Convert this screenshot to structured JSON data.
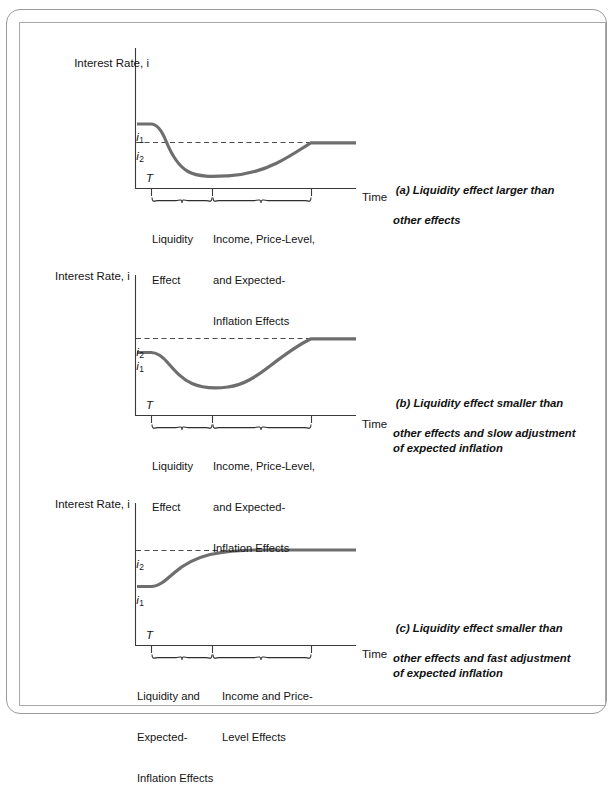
{
  "figure": {
    "title_present": false,
    "background_color": "#ffffff",
    "curve_color": "#6e6e6e",
    "axis_color": "#3a3a3a",
    "frame_color": "#9a9a9a"
  },
  "common": {
    "y_axis_title": "Interest Rate, ",
    "y_axis_title_symbol": "i",
    "x_axis_title": "Time",
    "t_marker": "T",
    "level_1_symbol": "i",
    "level_1_subscript": "1",
    "level_2_symbol": "i",
    "level_2_subscript": "2"
  },
  "panels": [
    {
      "id": "a",
      "caption_lead": "(a) Liquidity effect larger than",
      "caption_rest": "other effects",
      "y_axis_title": "Interest Rate, i",
      "x_axis_title": "Time",
      "t_marker": "T",
      "labels": {
        "i1": "i",
        "i1_sub": "1",
        "i2": "i",
        "i2_sub": "2"
      },
      "i1_above_i2": true,
      "brackets": [
        {
          "name": "liquidity-effect",
          "lines": [
            "Liquidity",
            "Effect"
          ]
        },
        {
          "name": "income-price-level-expected-inflation-effects",
          "lines": [
            "Income, Price-Level,",
            "and Expected-",
            "Inflation Effects"
          ]
        }
      ]
    },
    {
      "id": "b",
      "caption_lead": "(b) Liquidity effect smaller than",
      "caption_rest": "other effects and slow adjustment\nof expected inflation",
      "y_axis_title": "Interest Rate, i",
      "x_axis_title": "Time",
      "t_marker": "T",
      "labels": {
        "i1": "i",
        "i1_sub": "1",
        "i2": "i",
        "i2_sub": "2"
      },
      "i1_above_i2": false,
      "brackets": [
        {
          "name": "liquidity-effect",
          "lines": [
            "Liquidity",
            "Effect"
          ]
        },
        {
          "name": "income-price-level-expected-inflation-effects",
          "lines": [
            "Income, Price-Level,",
            "and Expected-",
            "Inflation Effects"
          ]
        }
      ]
    },
    {
      "id": "c",
      "caption_lead": "(c) Liquidity effect smaller than",
      "caption_rest": "other effects and fast adjustment\nof expected inflation",
      "y_axis_title": "Interest Rate, i",
      "x_axis_title": "Time",
      "t_marker": "T",
      "labels": {
        "i1": "i",
        "i1_sub": "1",
        "i2": "i",
        "i2_sub": "2"
      },
      "i1_above_i2": false,
      "brackets": [
        {
          "name": "liquidity-and-expected-inflation-effects",
          "lines": [
            "Liquidity and",
            "Expected-",
            "Inflation Effects"
          ]
        },
        {
          "name": "income-and-price-level-effects",
          "lines": [
            "Income and Price-",
            "Level Effects"
          ]
        }
      ]
    }
  ],
  "chart_data": {
    "type": "line",
    "xlabel": "Time",
    "ylabel": "Interest Rate, i",
    "grid": false,
    "legend": "none",
    "panels": [
      {
        "id": "a",
        "caption": "(a) Liquidity effect larger than other effects",
        "levels": {
          "i1": 1.0,
          "i2": 0.78
        },
        "t": 0.15,
        "series": [
          {
            "name": "interest rate path (a)",
            "x": [
              0.0,
              0.15,
              0.22,
              0.3,
              0.4,
              0.5,
              0.62,
              0.72,
              0.8,
              0.81,
              1.0
            ],
            "y": [
              1.0,
              1.0,
              0.88,
              0.7,
              0.6,
              0.575,
              0.61,
              0.68,
              0.78,
              0.78,
              0.78
            ]
          }
        ],
        "annotations": [
          {
            "text": "Liquidity Effect",
            "x_span": [
              0.15,
              0.32
            ]
          },
          {
            "text": "Income, Price-Level, and Expected-Inflation Effects",
            "x_span": [
              0.32,
              0.81
            ]
          }
        ]
      },
      {
        "id": "b",
        "caption": "(b) Liquidity effect smaller than other effects and slow adjustment of expected inflation",
        "levels": {
          "i1": 0.72,
          "i2": 0.9
        },
        "t": 0.15,
        "series": [
          {
            "name": "interest rate path (b)",
            "x": [
              0.0,
              0.15,
              0.24,
              0.34,
              0.45,
              0.52,
              0.62,
              0.72,
              0.8,
              0.81,
              1.0
            ],
            "y": [
              0.72,
              0.72,
              0.63,
              0.52,
              0.46,
              0.455,
              0.54,
              0.7,
              0.9,
              0.9,
              0.9
            ]
          }
        ],
        "annotations": [
          {
            "text": "Liquidity Effect",
            "x_span": [
              0.15,
              0.32
            ]
          },
          {
            "text": "Income, Price-Level, and Expected-Inflation Effects",
            "x_span": [
              0.32,
              0.81
            ]
          }
        ]
      },
      {
        "id": "c",
        "caption": "(c) Liquidity effect smaller than other effects and fast adjustment of expected inflation",
        "levels": {
          "i1": 0.52,
          "i2": 0.86
        },
        "t": 0.15,
        "series": [
          {
            "name": "interest rate path (c)",
            "x": [
              0.0,
              0.15,
              0.22,
              0.3,
              0.4,
              0.52,
              0.62,
              0.72,
              0.81,
              1.0
            ],
            "y": [
              0.52,
              0.52,
              0.62,
              0.71,
              0.79,
              0.845,
              0.858,
              0.86,
              0.86,
              0.86
            ]
          }
        ],
        "annotations": [
          {
            "text": "Liquidity and Expected-Inflation Effects",
            "x_span": [
              0.15,
              0.32
            ]
          },
          {
            "text": "Income and Price-Level Effects",
            "x_span": [
              0.32,
              0.81
            ]
          }
        ]
      }
    ]
  }
}
